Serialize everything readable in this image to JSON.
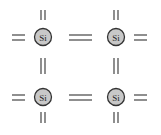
{
  "diagram": {
    "atom_label": "Si",
    "atom_fill": "#c8c8c8",
    "atom_stroke": "#333333",
    "bond_color": "#444444",
    "atoms": [
      {
        "id": "si-top-left",
        "label": "Si"
      },
      {
        "id": "si-top-right",
        "label": "Si"
      },
      {
        "id": "si-bottom-left",
        "label": "Si"
      },
      {
        "id": "si-bottom-right",
        "label": "Si"
      }
    ],
    "bond_type": "double-line (shared electron pair)"
  }
}
